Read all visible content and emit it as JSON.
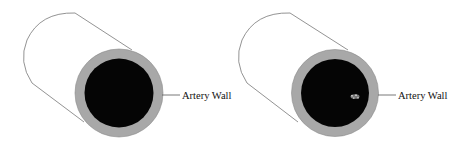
{
  "diagram": {
    "panels": [
      {
        "id": "healthy-artery",
        "label": "Artery Wall",
        "has_plaque": false
      },
      {
        "id": "artery-with-plaque",
        "label": "Artery Wall",
        "has_plaque": true
      }
    ],
    "colors": {
      "outline": "#777777",
      "wall": "#a8a8a8",
      "lumen": "#050505",
      "plaque": "#9a9a9a",
      "background": "#ffffff"
    }
  }
}
